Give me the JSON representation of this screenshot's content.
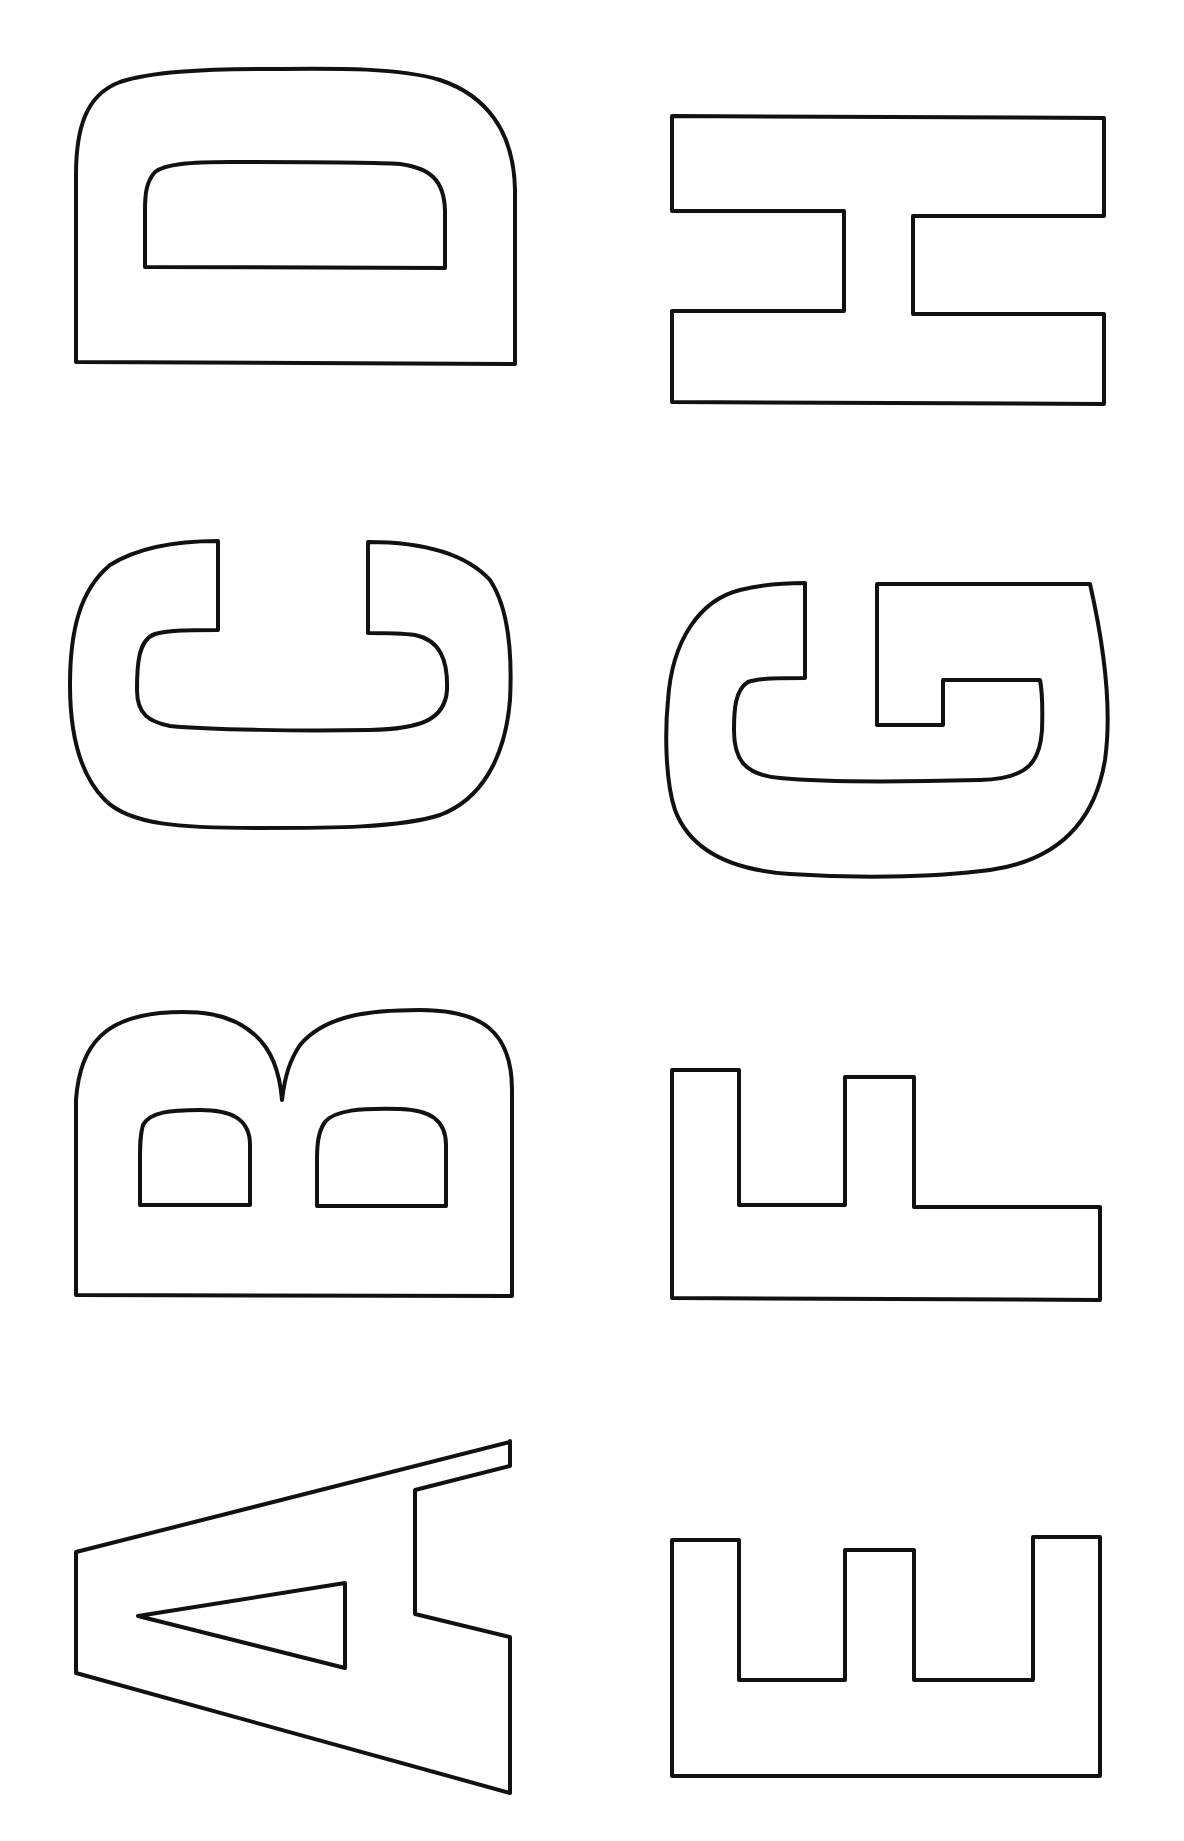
{
  "sheet": {
    "title": "Block letter outlines",
    "orientation": "rotated 90° counter-clockwise",
    "stroke_color": "#111111",
    "background": "#ffffff",
    "columns": [
      {
        "name": "left",
        "letters": [
          "D",
          "C",
          "B",
          "A"
        ]
      },
      {
        "name": "right",
        "letters": [
          "H",
          "G",
          "F",
          "E"
        ]
      }
    ],
    "letters": [
      {
        "char": "A"
      },
      {
        "char": "B"
      },
      {
        "char": "C"
      },
      {
        "char": "D"
      },
      {
        "char": "E"
      },
      {
        "char": "F"
      },
      {
        "char": "G"
      },
      {
        "char": "H"
      }
    ]
  }
}
